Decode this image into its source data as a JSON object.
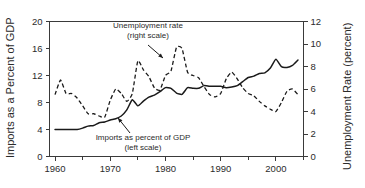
{
  "chart_data": {
    "type": "line",
    "title": "",
    "xlabel": "",
    "ylabel": "Imports as a Percent of GDP",
    "y2label": "Unemployment Rate (percent)",
    "xlim": [
      1959,
      2005
    ],
    "ylim": [
      0,
      20
    ],
    "y2lim": [
      0,
      12
    ],
    "grid": false,
    "legend": "annotations-inline",
    "xticks": [
      1960,
      1970,
      1980,
      1990,
      2000
    ],
    "xtick_labels": [
      "1960",
      "1970",
      "1980",
      "1990",
      "2000"
    ],
    "xminor_ticks": [
      1965,
      1975,
      1985,
      1995,
      2005
    ],
    "yticks": [
      0,
      4,
      8,
      12,
      16,
      20
    ],
    "ytick_labels": [
      "0",
      "4",
      "8",
      "12",
      "16",
      "20"
    ],
    "y2ticks": [
      0,
      2,
      4,
      6,
      8,
      10,
      12
    ],
    "y2tick_labels": [
      "0",
      "2",
      "4",
      "6",
      "8",
      "10",
      "12"
    ],
    "x": [
      1960,
      1961,
      1962,
      1963,
      1964,
      1965,
      1966,
      1967,
      1968,
      1969,
      1970,
      1971,
      1972,
      1973,
      1974,
      1975,
      1976,
      1977,
      1978,
      1979,
      1980,
      1981,
      1982,
      1983,
      1984,
      1985,
      1986,
      1987,
      1988,
      1989,
      1990,
      1991,
      1992,
      1993,
      1994,
      1995,
      1996,
      1997,
      1998,
      1999,
      2000,
      2001,
      2002,
      2003,
      2004
    ],
    "series": [
      {
        "name": "Imports as percent of GDP",
        "axis": "left",
        "style": "solid",
        "unit": "percent of GDP",
        "values": [
          4.0,
          4.0,
          4.0,
          4.0,
          4.0,
          4.2,
          4.5,
          4.6,
          5.0,
          5.1,
          5.4,
          5.6,
          6.0,
          6.9,
          8.4,
          7.5,
          8.2,
          8.8,
          9.1,
          9.6,
          10.2,
          10.1,
          9.4,
          9.2,
          10.2,
          10.1,
          10.1,
          10.5,
          10.4,
          10.4,
          10.4,
          10.2,
          10.3,
          10.5,
          11.1,
          11.7,
          11.9,
          12.3,
          12.4,
          13.1,
          14.4,
          13.3,
          13.2,
          13.5,
          14.3
        ]
      },
      {
        "name": "Unemployment rate",
        "axis": "right",
        "style": "dashed",
        "unit": "percent",
        "values": [
          5.5,
          6.8,
          5.6,
          5.6,
          5.2,
          4.5,
          3.8,
          3.8,
          3.6,
          3.5,
          5.0,
          6.0,
          5.6,
          4.9,
          5.6,
          8.5,
          7.7,
          7.1,
          6.1,
          5.9,
          7.2,
          7.6,
          9.7,
          9.6,
          7.5,
          7.2,
          7.0,
          6.2,
          5.5,
          5.3,
          5.6,
          6.9,
          7.5,
          6.9,
          6.1,
          5.6,
          5.4,
          4.9,
          4.5,
          4.2,
          4.0,
          4.8,
          5.8,
          6.0,
          5.5
        ]
      }
    ],
    "annotations": [
      {
        "name": "unemployment-annotation",
        "line1": "Unemployment rate",
        "line2": "(right scale)",
        "text_x": 148,
        "text_y": 28,
        "arrow_from_x": 148,
        "arrow_from_y": 45,
        "arrow_to_x": 163,
        "arrow_to_y": 58
      },
      {
        "name": "imports-annotation",
        "line1": "Imports as percent of GDP",
        "line2": "(left scale)",
        "text_x": 143,
        "text_y": 140,
        "arrow_from_x": 130,
        "arrow_from_y": 133,
        "arrow_to_x": 118,
        "arrow_to_y": 118
      }
    ],
    "colors": {
      "series_line": "#1a1a1a",
      "axis": "#3a3a3a",
      "text": "#2b2b2b",
      "background": "#ffffff"
    }
  }
}
